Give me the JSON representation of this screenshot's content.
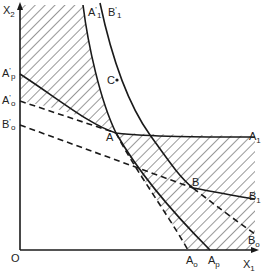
{
  "diagram": {
    "type": "isoquant-production-diagram",
    "axes": {
      "y_label": "X",
      "y_label_sub": "2",
      "x_label": "X",
      "x_label_sub": "1",
      "origin_label": "O"
    },
    "curves": {
      "A1_prime": {
        "label": "A",
        "prime": "'",
        "sub": "1"
      },
      "B1_prime": {
        "label": "B",
        "prime": "'",
        "sub": "1"
      },
      "A1": {
        "label": "A",
        "sub": "1"
      },
      "B1": {
        "label": "B",
        "sub": "1"
      },
      "B0": {
        "label": "B",
        "sub": "o"
      }
    },
    "axis_labels": {
      "Ap_prime": {
        "label": "A",
        "prime": "'",
        "sub": "p"
      },
      "Ao_prime": {
        "label": "A",
        "prime": "'",
        "sub": "o"
      },
      "Bo_prime": {
        "label": "B",
        "prime": "'",
        "sub": "o"
      },
      "Ao": {
        "label": "A",
        "sub": "o"
      },
      "Ap": {
        "label": "A",
        "sub": "p"
      }
    },
    "points": {
      "A": "A",
      "B": "B",
      "C": "C"
    },
    "colors": {
      "line": "#1a1a1a",
      "hatch": "#333333",
      "background": "#ffffff"
    }
  }
}
